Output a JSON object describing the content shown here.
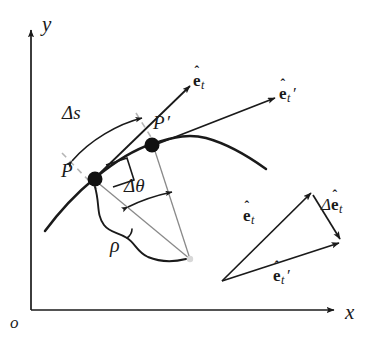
{
  "figure": {
    "background_color": "#ffffff",
    "ink_color": "#1a1a1a",
    "faint_color": "#9a9a9a"
  },
  "axes": {
    "y_label": "y",
    "x_label": "x",
    "origin_label": "o"
  },
  "curve_points": {
    "P": {
      "label": "P",
      "prime": ""
    },
    "P_prime": {
      "label": "P",
      "prime": "′"
    }
  },
  "labels": {
    "delta_s": "Δs",
    "delta_theta": "Δθ",
    "rho": "ρ",
    "e_letter": "e",
    "hat": "ˆ",
    "subscript_t": "t",
    "prime": "′",
    "delta": "Δ"
  },
  "vectors": {
    "et_on_curve": {
      "name": "e",
      "sub": "t",
      "prime": "",
      "description": "unit tangent at P"
    },
    "et_prime_on_curve": {
      "name": "e",
      "sub": "t",
      "prime": "′",
      "description": "unit tangent at P prime"
    },
    "et_triangle": {
      "name": "e",
      "sub": "t",
      "prime": "",
      "description": "unit tangent vector in vector triangle"
    },
    "et_prime_triangle": {
      "name": "e",
      "sub": "t",
      "prime": "′",
      "description": "rotated unit tangent vector in vector triangle"
    },
    "delta_et_triangle": {
      "delta": "Δ",
      "name": "e",
      "sub": "t",
      "prime": "",
      "description": "change in unit tangent vector"
    }
  }
}
